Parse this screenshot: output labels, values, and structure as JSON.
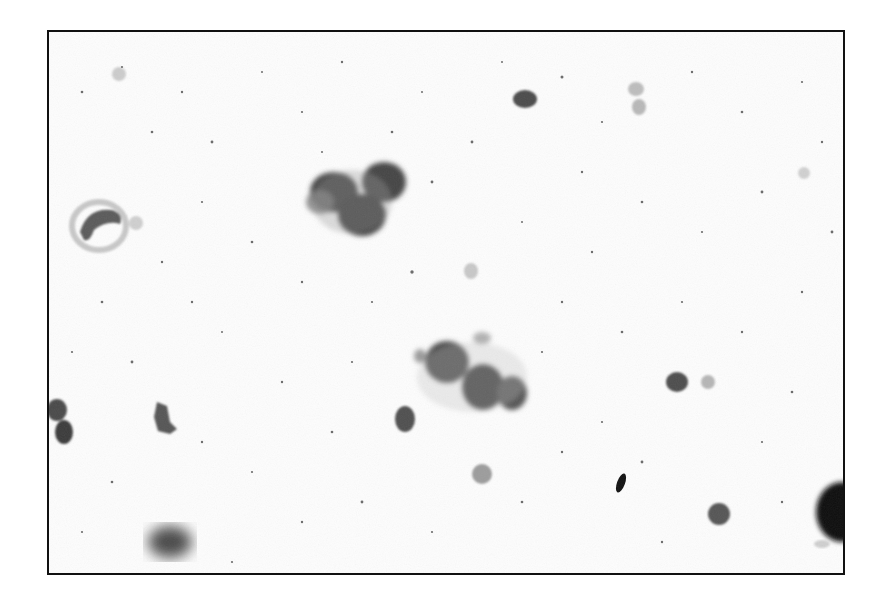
{
  "image": {
    "caption": "Grayscale micrograph of scattered cells and cell clusters on a speckled background",
    "frame_color": "#111111",
    "background_color": "#fdfdfd",
    "objects": [
      {
        "name": "cell-cluster-top",
        "x": 355,
        "y": 195,
        "desc": "cluster of three dark cells"
      },
      {
        "name": "cell-cluster-center",
        "x": 470,
        "y": 370,
        "desc": "cluster of three dark granular cells"
      },
      {
        "name": "ring-cell-left",
        "x": 95,
        "y": 225,
        "desc": "pale ring-shaped cell"
      },
      {
        "name": "cells-left-edge",
        "x": 60,
        "y": 420,
        "desc": "two dark cells at left edge"
      },
      {
        "name": "irregular-cell-left",
        "x": 160,
        "y": 415,
        "desc": "irregular small cell"
      },
      {
        "name": "blurred-cell-bottom-left",
        "x": 165,
        "y": 540,
        "desc": "out-of-focus dark blob"
      },
      {
        "name": "oval-cell-top",
        "x": 523,
        "y": 97,
        "desc": "dark oval cell"
      },
      {
        "name": "pale-ovals-top-right",
        "x": 636,
        "y": 97,
        "desc": "two pale oval cells"
      },
      {
        "name": "oval-cell-mid",
        "x": 403,
        "y": 417,
        "desc": "dark oval cell"
      },
      {
        "name": "pale-cell-bottom",
        "x": 480,
        "y": 472,
        "desc": "pale round cell"
      },
      {
        "name": "oval-cell-right",
        "x": 675,
        "y": 380,
        "desc": "dark oval cell"
      },
      {
        "name": "dark-fleck",
        "x": 619,
        "y": 481,
        "desc": "small very dark elongated fleck"
      },
      {
        "name": "oval-cell-bottom-right",
        "x": 717,
        "y": 512,
        "desc": "dark oval cell"
      },
      {
        "name": "dark-blob-right-edge",
        "x": 830,
        "y": 510,
        "desc": "large very dark blob cut by frame"
      }
    ]
  }
}
